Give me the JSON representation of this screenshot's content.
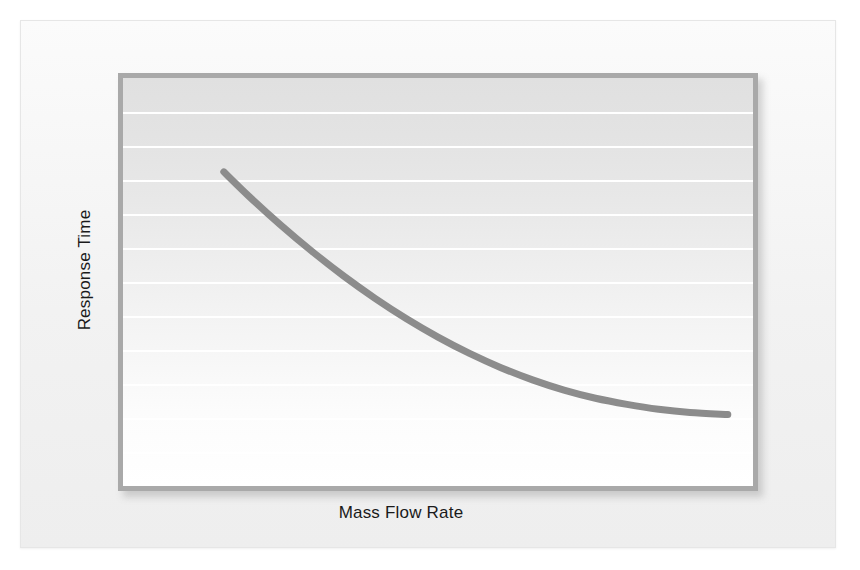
{
  "figure": {
    "background_color": "#f2f2f2",
    "frame_border_color": "#e6e6e6"
  },
  "chart_data": {
    "type": "line",
    "title": "",
    "subtitle": "",
    "xlabel": "Mass Flow Rate",
    "ylabel": "Response Time",
    "x_tick_labels": [],
    "y_tick_labels": [],
    "grid": "horizontal",
    "grid_line_count": 11,
    "legend": "none",
    "xlim": [
      0,
      100
    ],
    "ylim": [
      0,
      100
    ],
    "series": [
      {
        "name": "Response Time vs Mass Flow Rate",
        "color": "#8c8c8c",
        "line_width": 7,
        "description": "Monotonically decreasing exponential-decay curve, steep at low mass flow rate and flattening toward an asymptote at high mass flow rate.",
        "x": [
          16,
          20,
          25,
          30,
          35,
          40,
          45,
          50,
          55,
          60,
          65,
          70,
          75,
          80,
          85,
          90,
          96
        ],
        "y": [
          77,
          71,
          64,
          57.5,
          51.5,
          46,
          41,
          36.5,
          32.5,
          29,
          26,
          23.5,
          21.5,
          20,
          18.8,
          18,
          17.5
        ]
      }
    ],
    "plot_background": {
      "type": "vertical-gradient",
      "top_color": "#e0e0e0",
      "bottom_color": "#ffffff"
    },
    "plot_border_color": "#a9a9a9",
    "gridline_color": "#ffffff"
  }
}
